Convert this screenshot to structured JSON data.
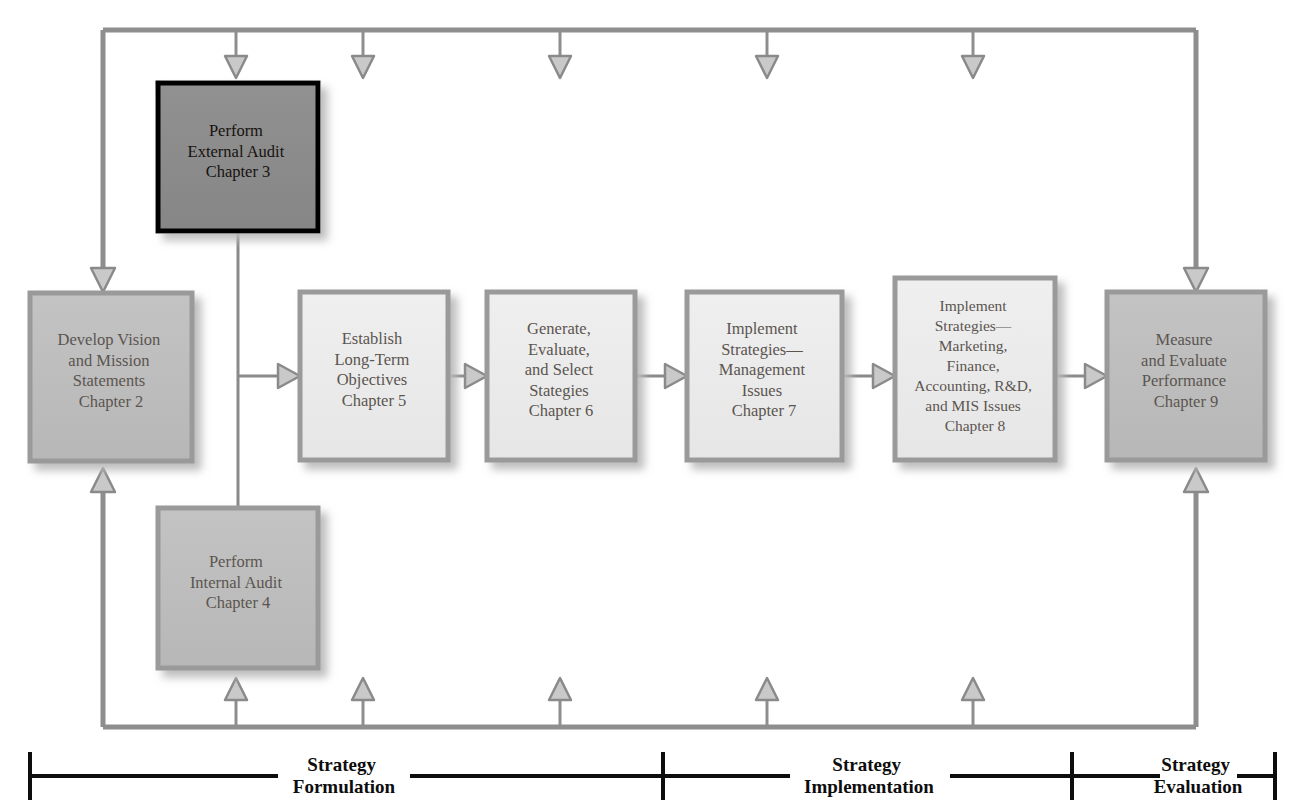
{
  "figure": {
    "type": "process-flow-diagram"
  },
  "colors": {
    "bus_line": "#8e8e8e",
    "connector_line": "#8a8a8a",
    "arrow_fill": "#c9c9c9",
    "arrow_stroke": "#8a8a8a",
    "highlight_box_fill": "#8c8c8c",
    "highlight_box_border": "#000000",
    "highlight_box_text": "#16120f",
    "mid_box_fill": "#bdbdbd",
    "mid_box_border": "#9a9a9a",
    "light_box_fill": "#ececec",
    "light_box_border": "#9a9a9a",
    "box_text": "#5b5550",
    "shadow": "#c4c4c4",
    "phase_rule": "#000000",
    "phase_text": "#0d0d0d",
    "background": "#ffffff"
  },
  "boxes": [
    {
      "id": "external-audit",
      "name": "perform-external-audit",
      "lines": [
        "Perform",
        "External Audit",
        "Chapter 3"
      ],
      "chapter": "Chapter 3",
      "style": "highlight",
      "x": 158,
      "y": 83,
      "w": 160,
      "h": 148
    },
    {
      "id": "vision-mission",
      "name": "develop-vision-and-mission-statements",
      "lines": [
        "Develop Vision",
        "and Mission",
        "Statements",
        "Chapter 2"
      ],
      "chapter": "Chapter 2",
      "style": "mid",
      "x": 30,
      "y": 293,
      "w": 162,
      "h": 168
    },
    {
      "id": "long-term-objectives",
      "name": "establish-long-term-objectives",
      "lines": [
        "Establish",
        "Long-Term",
        "Objectives",
        "Chapter 5"
      ],
      "chapter": "Chapter 5",
      "style": "light",
      "x": 300,
      "y": 292,
      "w": 148,
      "h": 168
    },
    {
      "id": "select-strategies",
      "name": "generate-evaluate-and-select-strategies",
      "lines": [
        "Generate,",
        "Evaluate,",
        "and Select",
        "Stategies",
        "Chapter 6"
      ],
      "chapter": "Chapter 6",
      "style": "light",
      "x": 487,
      "y": 292,
      "w": 148,
      "h": 168
    },
    {
      "id": "implement-management",
      "name": "implement-strategies-management-issues",
      "lines": [
        "Implement",
        "Strategies—",
        "Management",
        "Issues",
        "Chapter 7"
      ],
      "chapter": "Chapter 7",
      "style": "light",
      "x": 687,
      "y": 292,
      "w": 155,
      "h": 168
    },
    {
      "id": "implement-functional",
      "name": "implement-strategies-marketing-finance-accounting-rd-mis-issues",
      "lines": [
        "Implement",
        "Strategies—",
        "Marketing,",
        "Finance,",
        "Accounting, R&D,",
        "and MIS Issues",
        "Chapter 8"
      ],
      "chapter": "Chapter 8",
      "style": "light",
      "x": 895,
      "y": 278,
      "w": 160,
      "h": 182
    },
    {
      "id": "measure-evaluate",
      "name": "measure-and-evaluate-performance",
      "lines": [
        "Measure",
        "and Evaluate",
        "Performance",
        "Chapter 9"
      ],
      "chapter": "Chapter 9",
      "style": "mid",
      "x": 1107,
      "y": 292,
      "w": 158,
      "h": 168
    },
    {
      "id": "internal-audit",
      "name": "perform-internal-audit",
      "lines": [
        "Perform",
        "Internal Audit",
        "Chapter 4"
      ],
      "chapter": "Chapter 4",
      "style": "mid",
      "x": 158,
      "y": 508,
      "w": 160,
      "h": 160
    }
  ],
  "phases": [
    {
      "id": "formulation",
      "name": "strategy-formulation",
      "lines": [
        "Strategy",
        "Formulation"
      ]
    },
    {
      "id": "implementation",
      "name": "strategy-implementation",
      "lines": [
        "Strategy",
        "Implementation"
      ]
    },
    {
      "id": "evaluation",
      "name": "strategy-evaluation",
      "lines": [
        "Strategy",
        "Evaluation"
      ]
    }
  ],
  "feedback": {
    "top_bus_label": "feedback-loop-top",
    "bottom_bus_label": "feedback-loop-bottom",
    "top_arrow_x": [
      236,
      363,
      560,
      767,
      973
    ],
    "bottom_arrow_x": [
      236,
      363,
      560,
      767,
      973
    ]
  }
}
